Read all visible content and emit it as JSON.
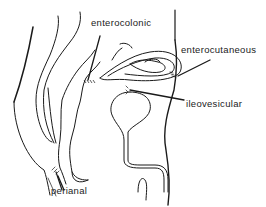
{
  "diagram": {
    "labels": {
      "enterocolonic": "enterocolonic",
      "enterocutaneous": "enterocutaneous",
      "ileovesicular": "ileovesicular",
      "perianal": "perianal"
    },
    "colors": {
      "line": "#1a1a1a",
      "background": "#ffffff"
    }
  }
}
